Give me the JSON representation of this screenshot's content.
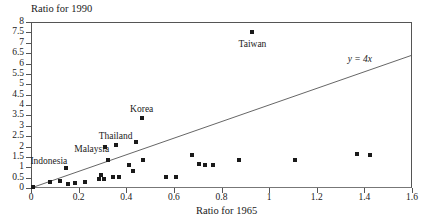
{
  "chart_data": {
    "type": "scatter",
    "title": "",
    "xlabel": "Ratio for 1965",
    "ylabel": "Ratio for 1990",
    "xlim": [
      0,
      1.6
    ],
    "ylim": [
      0,
      8
    ],
    "grid": false,
    "legend": "none",
    "xticks": [
      0,
      0.2,
      0.4,
      0.6,
      0.8,
      1,
      1.2,
      1.4,
      1.6
    ],
    "xticklabels": [
      "0",
      "0.2",
      "0.4",
      "0.6",
      "0.8",
      "1",
      "1.2",
      "1.4",
      "1.6"
    ],
    "yticks": [
      0,
      0.5,
      1,
      1.5,
      2,
      2.5,
      3,
      3.5,
      4,
      4.5,
      5,
      5.5,
      6,
      6.5,
      7,
      7.5,
      8
    ],
    "yticklabels": [
      "0",
      "0.5",
      "1",
      "1.5",
      "2",
      "2.5",
      "3",
      "3.5",
      "4",
      "4.5",
      "5",
      "5.5",
      "6",
      "6.5",
      "7",
      "7.5",
      "8"
    ],
    "reference_line": {
      "label": "y = 4x",
      "slope": 4,
      "intercept": 0,
      "x_start": 0,
      "y_start": 0,
      "x_end": 1.6,
      "y_end": 6.4
    },
    "points": [
      {
        "x": 0.01,
        "y": 0.06,
        "label": ""
      },
      {
        "x": 0.08,
        "y": 0.3,
        "label": ""
      },
      {
        "x": 0.12,
        "y": 0.35,
        "label": ""
      },
      {
        "x": 0.145,
        "y": 0.95,
        "label": "Indonesia"
      },
      {
        "x": 0.155,
        "y": 0.2,
        "label": ""
      },
      {
        "x": 0.185,
        "y": 0.25,
        "label": ""
      },
      {
        "x": 0.225,
        "y": 0.28,
        "label": ""
      },
      {
        "x": 0.285,
        "y": 0.45,
        "label": ""
      },
      {
        "x": 0.295,
        "y": 0.62,
        "label": ""
      },
      {
        "x": 0.305,
        "y": 0.45,
        "label": ""
      },
      {
        "x": 0.31,
        "y": 2.0,
        "label": "Malaysia"
      },
      {
        "x": 0.325,
        "y": 1.35,
        "label": ""
      },
      {
        "x": 0.345,
        "y": 0.55,
        "label": ""
      },
      {
        "x": 0.355,
        "y": 2.05,
        "label": "Thailand"
      },
      {
        "x": 0.37,
        "y": 0.55,
        "label": ""
      },
      {
        "x": 0.41,
        "y": 1.1,
        "label": ""
      },
      {
        "x": 0.43,
        "y": 0.8,
        "label": ""
      },
      {
        "x": 0.44,
        "y": 2.2,
        "label": ""
      },
      {
        "x": 0.465,
        "y": 3.35,
        "label": "Korea"
      },
      {
        "x": 0.47,
        "y": 1.35,
        "label": ""
      },
      {
        "x": 0.565,
        "y": 0.55,
        "label": ""
      },
      {
        "x": 0.61,
        "y": 0.52,
        "label": ""
      },
      {
        "x": 0.675,
        "y": 1.6,
        "label": ""
      },
      {
        "x": 0.705,
        "y": 1.15,
        "label": ""
      },
      {
        "x": 0.73,
        "y": 1.1,
        "label": ""
      },
      {
        "x": 0.765,
        "y": 1.1,
        "label": ""
      },
      {
        "x": 0.875,
        "y": 1.35,
        "label": ""
      },
      {
        "x": 0.93,
        "y": 7.5,
        "label": "Taiwan"
      },
      {
        "x": 1.11,
        "y": 1.35,
        "label": ""
      },
      {
        "x": 1.37,
        "y": 1.62,
        "label": ""
      },
      {
        "x": 1.425,
        "y": 1.6,
        "label": ""
      }
    ],
    "annotations": [
      {
        "text": "Taiwan",
        "x": 0.93,
        "y": 7.5,
        "dy": 13,
        "anchor": "middle"
      },
      {
        "text": "Korea",
        "x": 0.465,
        "y": 3.35,
        "dy": -8,
        "anchor": "middle"
      },
      {
        "text": "Thailand",
        "x": 0.355,
        "y": 2.05,
        "dy": -8,
        "anchor": "middle"
      },
      {
        "text": "Malaysia",
        "x": 0.255,
        "y": 2.0,
        "dy": 3,
        "anchor": "middle"
      },
      {
        "text": "Indonesia",
        "x": 0.075,
        "y": 1.42,
        "dy": 3,
        "anchor": "middle"
      }
    ],
    "colors": {
      "marker": "#1a1a1a",
      "line": "#555555",
      "axis": "#555555",
      "background": "#ffffff"
    }
  }
}
